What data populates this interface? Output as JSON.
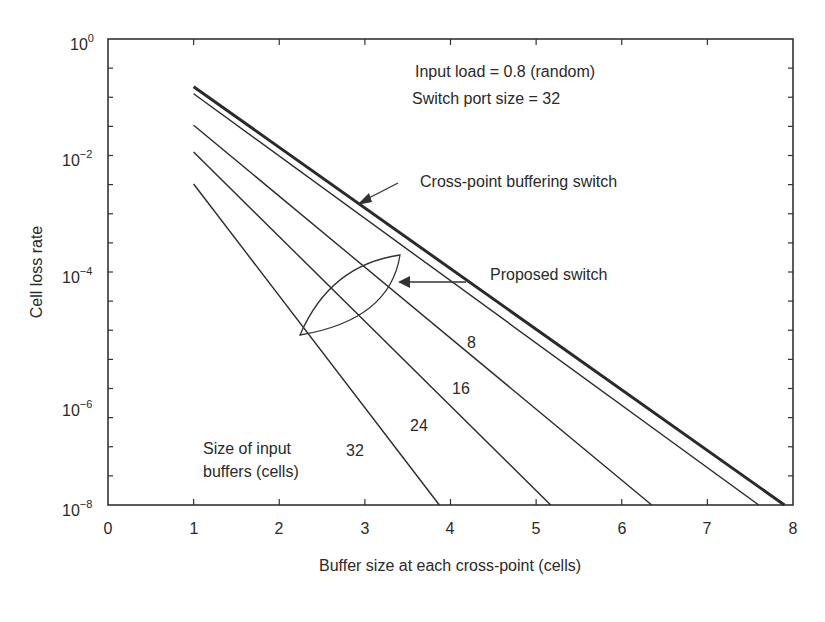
{
  "chart_data": {
    "type": "line",
    "title": "",
    "xlabel": "Buffer size at each cross-point (cells)",
    "ylabel": "Cell loss rate",
    "xlim": [
      0,
      8
    ],
    "ylim": [
      1e-08,
      1
    ],
    "yscale": "log",
    "x_ticks": [
      "0",
      "1",
      "2",
      "3",
      "4",
      "5",
      "6",
      "7",
      "8"
    ],
    "y_ticks": [
      {
        "base": "10",
        "exp": "0"
      },
      {
        "base": "10",
        "exp": "−2"
      },
      {
        "base": "10",
        "exp": "−4"
      },
      {
        "base": "10",
        "exp": "−6"
      },
      {
        "base": "10",
        "exp": "−8"
      }
    ],
    "grid": false,
    "series": [
      {
        "name": "Cross-point buffering switch",
        "style": "thick",
        "x": [
          1,
          7.9
        ],
        "log10_y": [
          -0.82,
          -8.0
        ]
      },
      {
        "name": "Proposed switch, input buffer 8",
        "label": "8",
        "style": "thin",
        "x": [
          1,
          7.6
        ],
        "log10_y": [
          -0.94,
          -8.0
        ]
      },
      {
        "name": "Proposed switch, input buffer 16",
        "label": "16",
        "style": "thin",
        "x": [
          1,
          6.35
        ],
        "log10_y": [
          -1.48,
          -8.0
        ]
      },
      {
        "name": "Proposed switch, input buffer 24",
        "label": "24",
        "style": "thin",
        "x": [
          1,
          5.17
        ],
        "log10_y": [
          -1.94,
          -8.0
        ]
      },
      {
        "name": "Proposed switch, input buffer 32",
        "label": "32",
        "style": "thin",
        "x": [
          1,
          3.87
        ],
        "log10_y": [
          -2.49,
          -8.0
        ]
      }
    ],
    "annotations": {
      "params_line1": "Input load = 0.8 (random)",
      "params_line2": "Switch port size = 32",
      "crosspoint_label": "Cross-point buffering switch",
      "proposed_label": "Proposed switch",
      "input_buffers_line1": "Size of input",
      "input_buffers_line2": "buffers (cells)",
      "curve_labels": [
        "8",
        "16",
        "24",
        "32"
      ]
    }
  }
}
